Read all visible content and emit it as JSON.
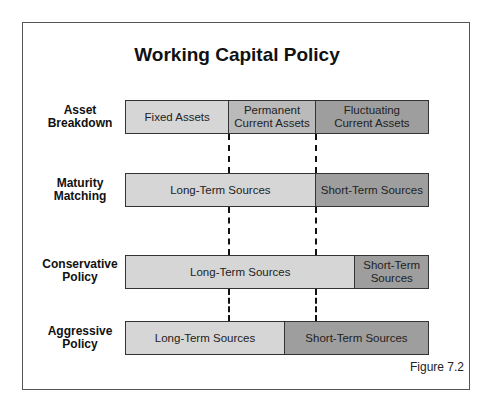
{
  "title": "Working Capital Policy",
  "figure_label": "Figure 7.2",
  "colors": {
    "light": "#d6d6d6",
    "mid": "#bababa",
    "dark": "#9e9e9e",
    "border": "#333333"
  },
  "rows": [
    {
      "label_line1": "Asset",
      "label_line2": "Breakdown",
      "segments": [
        {
          "line1": "Fixed Assets",
          "line2": "",
          "shade": "light",
          "width_px": 104
        },
        {
          "line1": "Permanent",
          "line2": "Current Assets",
          "shade": "mid",
          "width_px": 87
        },
        {
          "line1": "Fluctuating",
          "line2": "Current Assets",
          "shade": "dark",
          "width_px": 113
        }
      ]
    },
    {
      "label_line1": "Maturity",
      "label_line2": "Matching",
      "segments": [
        {
          "line1": "Long-Term Sources",
          "line2": "",
          "shade": "light",
          "width_px": 191
        },
        {
          "line1": "Short-Term Sources",
          "line2": "",
          "shade": "dark",
          "width_px": 113
        }
      ]
    },
    {
      "label_line1": "Conservative",
      "label_line2": "Policy",
      "segments": [
        {
          "line1": "Long-Term Sources",
          "line2": "",
          "shade": "light",
          "width_px": 231
        },
        {
          "line1": "Short-Term",
          "line2": "Sources",
          "shade": "dark",
          "width_px": 73
        }
      ]
    },
    {
      "label_line1": "Aggressive",
      "label_line2": "Policy",
      "segments": [
        {
          "line1": "Long-Term Sources",
          "line2": "",
          "shade": "light",
          "width_px": 160
        },
        {
          "line1": "Short-Term Sources",
          "line2": "",
          "shade": "dark",
          "width_px": 144
        }
      ]
    }
  ]
}
